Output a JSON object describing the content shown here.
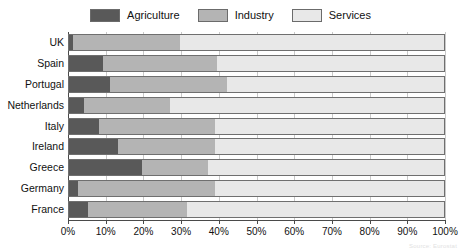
{
  "chart_data": {
    "type": "bar",
    "orientation": "horizontal",
    "stacked": true,
    "normalized_percent": true,
    "title": "",
    "xlabel": "",
    "ylabel": "",
    "xlim": [
      0,
      100
    ],
    "grid": true,
    "legend_position": "top-center",
    "categories": [
      "UK",
      "Spain",
      "Portugal",
      "Netherlands",
      "Italy",
      "Ireland",
      "Greece",
      "Germany",
      "France"
    ],
    "xticks": [
      0,
      10,
      20,
      30,
      40,
      50,
      60,
      70,
      80,
      90,
      100
    ],
    "xticklabels": [
      "0%",
      "10%",
      "20%",
      "30%",
      "40%",
      "50%",
      "60%",
      "70%",
      "80%",
      "90%",
      "100%"
    ],
    "series": [
      {
        "name": "Agriculture",
        "color": "#595959",
        "values": [
          1,
          9,
          11,
          4,
          8,
          13,
          19.5,
          2.5,
          5
        ]
      },
      {
        "name": "Industry",
        "color": "#b4b4b4",
        "values": [
          28.5,
          30.5,
          31,
          23,
          31,
          26,
          17.5,
          36.5,
          26.5
        ]
      },
      {
        "name": "Services",
        "color": "#e8e8e8",
        "values": [
          70.5,
          60.5,
          58,
          73,
          61,
          61,
          63,
          61,
          68.5
        ]
      }
    ]
  },
  "legend": {
    "items": [
      {
        "label": "Agriculture",
        "color": "#595959"
      },
      {
        "label": "Industry",
        "color": "#b4b4b4"
      },
      {
        "label": "Services",
        "color": "#e8e8e8"
      }
    ]
  },
  "caption": {
    "source": "Source: Eurostat"
  }
}
